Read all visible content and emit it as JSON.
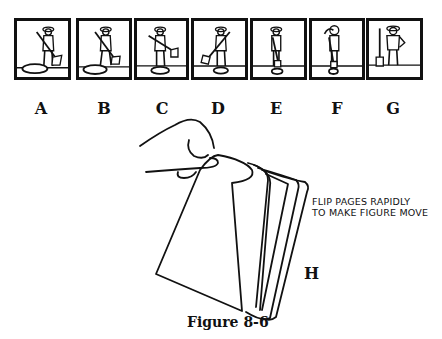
{
  "frames": [
    {
      "label": "A",
      "pose": "sweeping-low",
      "x": 14,
      "w": 57
    },
    {
      "label": "B",
      "pose": "sweeping-mid",
      "x": 76,
      "w": 56
    },
    {
      "label": "C",
      "pose": "sweeping-up",
      "x": 134,
      "w": 55
    },
    {
      "label": "D",
      "pose": "broom-forward",
      "x": 191,
      "w": 57
    },
    {
      "label": "E",
      "pose": "leaning-on-broom",
      "x": 250,
      "w": 57
    },
    {
      "label": "F",
      "pose": "wiping-brow",
      "x": 309,
      "w": 56
    },
    {
      "label": "G",
      "pose": "standing-hand-on-hip",
      "x": 366,
      "w": 57
    }
  ],
  "labels": {
    "A": "A",
    "B": "B",
    "C": "C",
    "D": "D",
    "E": "E",
    "F": "F",
    "G": "G",
    "H": "H"
  },
  "note": {
    "line1": "FLIP PAGES RAPIDLY",
    "line2": "TO MAKE FIGURE MOVE"
  },
  "caption": "Figure 8-6",
  "colors": {
    "ink": "#111111",
    "paper": "#ffffff"
  }
}
